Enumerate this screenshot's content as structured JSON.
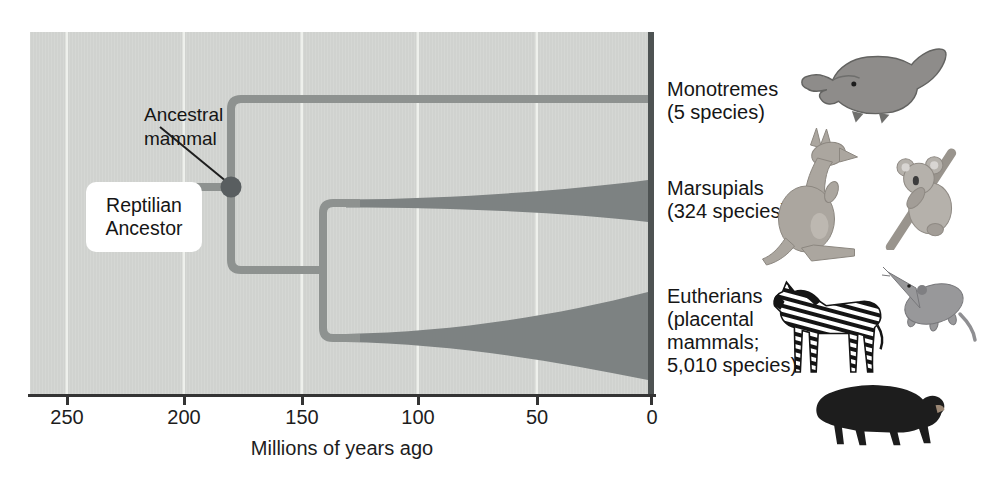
{
  "labels": {
    "ancestral_mammal": {
      "line1": "Ancestral",
      "line2": "mammal"
    },
    "reptilian_ancestor": {
      "line1": "Reptilian",
      "line2": "Ancestor"
    }
  },
  "clades": [
    {
      "id": "monotremes",
      "name": "Monotremes",
      "detail_lines": [
        "(5 species)"
      ],
      "species_count": 5,
      "icons": [
        "platypus"
      ]
    },
    {
      "id": "marsupials",
      "name": "Marsupials",
      "detail_lines": [
        "(324 species)"
      ],
      "species_count": 324,
      "icons": [
        "kangaroo",
        "koala"
      ]
    },
    {
      "id": "eutherians",
      "name": "Eutherians",
      "detail_lines": [
        "(placental",
        "mammals;",
        "5,010 species)"
      ],
      "species_count": 5010,
      "icons": [
        "zebra",
        "shrew",
        "bear"
      ]
    }
  ],
  "axis": {
    "tick_labels": [
      "250",
      "200",
      "150",
      "100",
      "50",
      "0"
    ],
    "title": "Millions of years ago"
  },
  "colors": {
    "plot_bg": "#d3d5d2",
    "gridline": "#eef0ec",
    "branch": "#8e9290",
    "wedge": "#7d8282",
    "node": "#595e60",
    "plot_right_border": "#4e5353",
    "axis": "#343434",
    "text": "#161616"
  }
}
